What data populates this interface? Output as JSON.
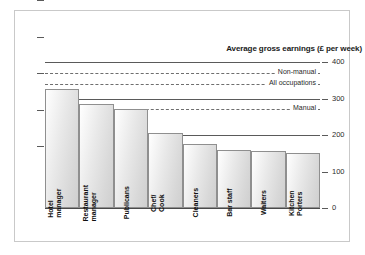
{
  "chart_data": {
    "type": "bar",
    "title": "Average gross earnings (£ per week)",
    "xlabel": "",
    "ylabel": "",
    "ylim": [
      0,
      400
    ],
    "yticks": [
      0,
      100,
      200,
      300,
      400
    ],
    "ytick_labels": [
      "0",
      "100",
      "200",
      "300",
      "400"
    ],
    "grid": true,
    "legend_position": "inline-right",
    "categories": [
      "Hotel manager",
      "Restaurant manager",
      "Publicans",
      "Chef/ Cook",
      "Cleaners",
      "Bar staff",
      "Waiters",
      "Kitchen Porters"
    ],
    "category_lines": [
      [
        "Hotel",
        "manager"
      ],
      [
        "Restaurant",
        "manager"
      ],
      [
        "Publicans"
      ],
      [
        "Chef/",
        "Cook"
      ],
      [
        "Cleaners"
      ],
      [
        "Bar staff"
      ],
      [
        "Waiters"
      ],
      [
        "Kitchen",
        "Porters"
      ]
    ],
    "values": [
      325,
      285,
      270,
      205,
      175,
      160,
      157,
      152
    ],
    "reference_lines": [
      {
        "label": "Non-manual",
        "value": 370
      },
      {
        "label": "All occupations",
        "value": 340
      },
      {
        "label": "Manual",
        "value": 270
      }
    ],
    "colors": {
      "bar_fill_light": "#ffffff",
      "bar_fill_dark": "#cfcfcf",
      "bar_stroke": "#8f8f8f",
      "gridline": "#5a5a5a",
      "refline": "#6e6e6e",
      "text": "#1a1a1a",
      "frame_border": "#c9c9c9",
      "background": "#ffffff"
    }
  }
}
